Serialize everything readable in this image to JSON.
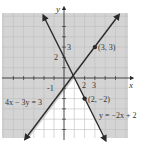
{
  "figure": {
    "type": "system-of-linear-inequalities-graph",
    "axes": {
      "x_label": "x",
      "y_label": "y",
      "x_ticks_labeled": [
        "2",
        "3"
      ],
      "y_ticks_labeled": [
        "3",
        "2",
        "-1"
      ],
      "x_range": [
        -6,
        6
      ],
      "y_range": [
        -6,
        6
      ]
    },
    "lines": [
      {
        "equation": "4x − 3y = 3",
        "slope": 1.333,
        "intercept": -1,
        "style": "solid"
      },
      {
        "equation": "y = −2x + 2",
        "slope": -2,
        "intercept": 2,
        "style": "solid"
      }
    ],
    "points": [
      {
        "label": "(3, 3)",
        "x": 3,
        "y": 3
      },
      {
        "label": "(2, −2)",
        "x": 2,
        "y": -2
      }
    ],
    "shading": {
      "shaded_color": "#d4d4d4",
      "unshaded_region": "below both lines"
    },
    "colors": {
      "line": "#2a2a2a",
      "grid": "#bdbdbd",
      "axis": "#333333",
      "background": "#ffffff"
    }
  }
}
